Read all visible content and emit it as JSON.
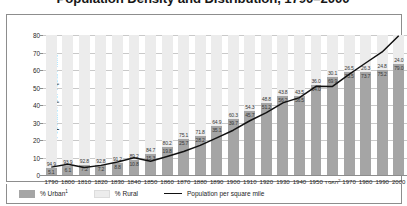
{
  "chart_data": {
    "type": "bar",
    "title": "Population Density and Distribution, 1790–2000",
    "xlabel": "",
    "ylabel": "Population per square mile",
    "ylim": [
      0,
      80
    ],
    "yticks": [
      0,
      10,
      20,
      30,
      40,
      50,
      60,
      70,
      80
    ],
    "grid": true,
    "legend_position": "bottom",
    "categories": [
      "1790",
      "1800",
      "1810",
      "1820",
      "1830",
      "1840",
      "1850",
      "1860",
      "1870",
      "1880",
      "1890",
      "1900",
      "1910",
      "1920",
      "1930",
      "1940",
      "1950",
      "1960",
      "1970",
      "1980",
      "1990",
      "2000"
    ],
    "xtick_superscripts": {
      "1960": "2"
    },
    "series": [
      {
        "name": "% Urban",
        "type": "bar-stacked-bottom",
        "color": "#a5a5a5",
        "values": [
          5.1,
          6.1,
          7.2,
          7.2,
          8.8,
          10.8,
          15.3,
          19.8,
          25.7,
          28.2,
          35.1,
          39.7,
          45.7,
          51.2,
          56.2,
          56.5,
          64.0,
          69.9,
          73.5,
          73.7,
          75.2,
          79.0
        ]
      },
      {
        "name": "% Rural",
        "type": "bar-stacked-top",
        "color": "#ececec",
        "values": [
          94.9,
          93.9,
          92.8,
          92.8,
          91.2,
          89.2,
          84.7,
          80.2,
          74.3,
          71.8,
          64.9,
          60.3,
          54.3,
          48.8,
          43.8,
          43.5,
          36.0,
          30.1,
          26.5,
          26.3,
          24.8,
          21.0
        ]
      },
      {
        "name": "Population per square mile",
        "type": "line",
        "color": "#111111",
        "values": [
          4.5,
          6.1,
          4.3,
          5.5,
          7.4,
          9.8,
          7.9,
          10.6,
          13.4,
          16.9,
          21.2,
          25.6,
          31.0,
          35.6,
          41.2,
          44.2,
          50.7,
          50.6,
          57.5,
          64.0,
          70.3,
          79.6
        ]
      }
    ],
    "data_labels": {
      "rural": [
        "94.9",
        "93.9",
        "92.8",
        "92.8",
        "91.2",
        "89.2",
        "84.7",
        "80.2",
        "75.1",
        "71.8",
        "64.9",
        "60.3",
        "54.3",
        "48.8",
        "43.8",
        "43.5",
        "36.0",
        "30.1",
        "26.5",
        "26.3",
        "24.8",
        "24.0"
      ],
      "urban": [
        "5.1",
        "6.1",
        "7.2",
        "7.2",
        "8.8",
        "10.8",
        "15.3",
        "19.8",
        "25.7",
        "28.2",
        "35.1",
        "39.7",
        "45.7",
        "51.2",
        "56.2",
        "56.5",
        "64.0",
        "69.9",
        "73.5",
        "73.7",
        "75.2",
        "79.0"
      ]
    }
  },
  "legend": {
    "urban_label": "% Urban",
    "urban_superscript": "1",
    "rural_label": "% Rural",
    "line_label": "Population per square mile"
  },
  "colors": {
    "urban": "#a5a5a5",
    "rural": "#ececec",
    "line": "#111111",
    "axis": "#8d8d8d",
    "grid": "#c9c9c9"
  }
}
